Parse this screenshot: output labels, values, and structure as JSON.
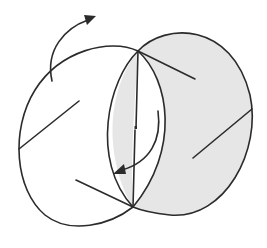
{
  "diagram": {
    "type": "geometric-rotation-illustration",
    "colors": {
      "stroke": "#2b2b2b",
      "shade": "#e6e6e6",
      "background": "#ffffff"
    },
    "elements": {
      "shaded_ellipse": {
        "cx": 192,
        "cy": 128,
        "rx": 62,
        "ry": 96,
        "rotation": -18
      },
      "open_ellipse": {
        "cx": 84,
        "cy": 138,
        "rx": 66,
        "ry": 92,
        "rotation": 20
      },
      "shared_chord": {
        "x1": 138,
        "y1": 51,
        "x2": 133,
        "y2": 207
      },
      "rotation_arrow_top": "curved arrow pointing up-right",
      "rotation_arrow_inner": "curved arrow pointing down-left"
    }
  }
}
